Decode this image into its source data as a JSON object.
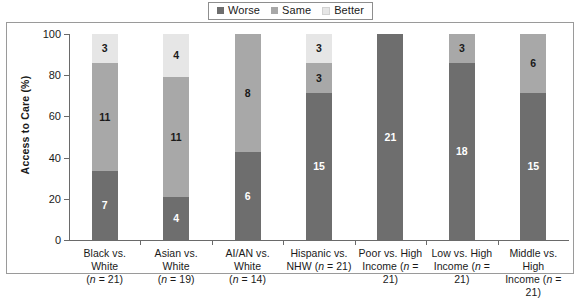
{
  "legend": {
    "items": [
      {
        "label": "Worse",
        "color": "#6e6e6e",
        "icon": "square-swatch-icon"
      },
      {
        "label": "Same",
        "color": "#a8a8a8",
        "icon": "square-swatch-icon"
      },
      {
        "label": "Better",
        "color": "#e6e6e6",
        "icon": "square-swatch-icon"
      }
    ]
  },
  "axes": {
    "ylabel": "Access to Care (%)",
    "yticks": [
      "0",
      "20",
      "40",
      "60",
      "80",
      "100"
    ]
  },
  "chart_data": {
    "type": "bar",
    "title": "",
    "subtitle": "",
    "xlabel": "",
    "ylabel": "Access to Care (%)",
    "ylim": [
      0,
      100
    ],
    "yticks": [
      0,
      20,
      40,
      60,
      80,
      100
    ],
    "grid": false,
    "stacked": true,
    "stack_order": [
      "Worse",
      "Same",
      "Better"
    ],
    "value_unit": "count of measures",
    "legend_position": "top-center",
    "categories": [
      "Black vs. White (n = 21)",
      "Asian vs. White (n = 19)",
      "AI/AN vs. White (n = 14)",
      "Hispanic vs. NHW (n = 21)",
      "Poor vs. High Income (n = 21)",
      "Low vs. High Income (n = 21)",
      "Middle vs. High Income (n = 21)"
    ],
    "category_lines": [
      {
        "line1": "Black vs. White",
        "line2": "(n = 21)",
        "n": 21
      },
      {
        "line1": "Asian vs. White",
        "line2": "(n = 19)",
        "n": 19
      },
      {
        "line1": "AI/AN vs. White",
        "line2": "(n = 14)",
        "n": 14
      },
      {
        "line1": "Hispanic vs.",
        "line2": "NHW (n = 21)",
        "n": 21
      },
      {
        "line1": "Poor vs. High",
        "line2": "Income (n = 21)",
        "n": 21
      },
      {
        "line1": "Low vs. High",
        "line2": "Income (n = 21)",
        "n": 21
      },
      {
        "line1": "Middle vs. High",
        "line2": "Income (n = 21)",
        "n": 21
      }
    ],
    "series": [
      {
        "name": "Worse",
        "color": "#6e6e6e",
        "values": [
          7,
          4,
          6,
          15,
          21,
          18,
          15
        ]
      },
      {
        "name": "Same",
        "color": "#a8a8a8",
        "values": [
          11,
          11,
          8,
          3,
          0,
          3,
          6
        ]
      },
      {
        "name": "Better",
        "color": "#e6e6e6",
        "values": [
          3,
          4,
          0,
          3,
          0,
          0,
          0
        ]
      }
    ],
    "totals": [
      21,
      19,
      14,
      21,
      21,
      21,
      21
    ],
    "percent_totals": [
      100,
      100,
      100,
      100,
      100,
      100,
      100
    ]
  }
}
